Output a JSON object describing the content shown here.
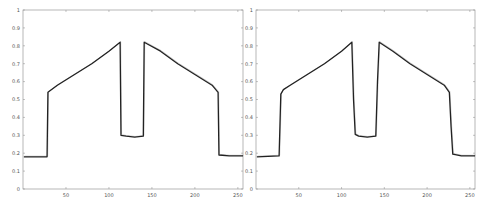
{
  "chart_data": [
    {
      "type": "line",
      "title": "",
      "xlabel": "",
      "ylabel": "",
      "xlim": [
        0,
        256
      ],
      "ylim": [
        0,
        1
      ],
      "grid": false,
      "legend": null,
      "xticks": [
        50,
        100,
        150,
        200,
        250
      ],
      "yticks": [
        0,
        0.1,
        0.2,
        0.3,
        0.4,
        0.5,
        0.6,
        0.7,
        0.8,
        0.9,
        1
      ],
      "series": [
        {
          "name": "signal",
          "x": [
            1,
            28,
            29,
            40,
            60,
            80,
            100,
            113,
            114,
            120,
            130,
            140,
            141,
            160,
            180,
            200,
            220,
            227,
            228,
            240,
            256
          ],
          "values": [
            0.18,
            0.18,
            0.54,
            0.58,
            0.64,
            0.7,
            0.77,
            0.82,
            0.3,
            0.295,
            0.29,
            0.295,
            0.82,
            0.77,
            0.7,
            0.64,
            0.58,
            0.54,
            0.19,
            0.185,
            0.185
          ]
        }
      ]
    },
    {
      "type": "line",
      "title": "",
      "xlabel": "",
      "ylabel": "",
      "xlim": [
        0,
        256
      ],
      "ylim": [
        0,
        1
      ],
      "grid": false,
      "legend": null,
      "xticks": [
        50,
        100,
        150,
        200,
        250
      ],
      "yticks": [
        0,
        0.1,
        0.2,
        0.3,
        0.4,
        0.5,
        0.6,
        0.7,
        0.8,
        0.9,
        1
      ],
      "series": [
        {
          "name": "signal",
          "x": [
            1,
            27,
            29,
            32,
            40,
            60,
            80,
            100,
            112,
            114,
            116,
            120,
            130,
            140,
            142,
            144,
            160,
            180,
            200,
            220,
            226,
            228,
            230,
            240,
            256
          ],
          "values": [
            0.18,
            0.185,
            0.53,
            0.555,
            0.58,
            0.64,
            0.7,
            0.77,
            0.82,
            0.5,
            0.305,
            0.295,
            0.29,
            0.295,
            0.6,
            0.82,
            0.77,
            0.7,
            0.64,
            0.58,
            0.54,
            0.35,
            0.195,
            0.185,
            0.185
          ]
        }
      ]
    }
  ],
  "plots": [
    {
      "box": {
        "x0": 23,
        "y0": 10,
        "x1": 243,
        "y1": 189
      }
    },
    {
      "box": {
        "x0": 256,
        "y0": 10,
        "x1": 475,
        "y1": 189
      }
    }
  ],
  "style": {
    "line_color": "#222222",
    "axis_color": "#888888",
    "label_color": "#555555"
  }
}
